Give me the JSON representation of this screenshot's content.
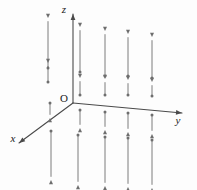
{
  "figure": {
    "background_color": "#fdfdfd",
    "axis_color": "#4a4a4a",
    "arrow_color": "#6e6e6e",
    "label_color": "#1a1a1a",
    "width": 197,
    "height": 190
  },
  "labels": {
    "origin": "O",
    "x_axis": "x",
    "y_axis": "y",
    "z_axis": "z"
  },
  "chart_data": {
    "type": "scatter",
    "xlabel": "x",
    "ylabel": "y",
    "zlabel": "z",
    "grid": false,
    "legend": null,
    "origin_px": [
      73,
      103
    ],
    "axes": [
      {
        "name": "z",
        "label": "z",
        "from_px": [
          73,
          103
        ],
        "to_px": [
          73,
          14
        ],
        "label_px": [
          64,
          13
        ],
        "direction": "up"
      },
      {
        "name": "y",
        "label": "y",
        "from_px": [
          73,
          103
        ],
        "to_px": [
          182,
          113
        ],
        "label_px": [
          178,
          124
        ],
        "direction": "right-down"
      },
      {
        "name": "x",
        "label": "x",
        "from_px": [
          73,
          103
        ],
        "to_px": [
          19,
          143
        ],
        "label_px": [
          13,
          142
        ],
        "direction": "left-down"
      }
    ],
    "arrows": [
      {
        "id": "up-a1",
        "x_px": 48,
        "tail_y_px": 68,
        "head_y_px": 18,
        "direction": "up",
        "length_px": 50
      },
      {
        "id": "up-a2",
        "x_px": 48,
        "tail_y_px": 82,
        "head_y_px": 63,
        "direction": "up",
        "length_px": 19
      },
      {
        "id": "up-b1",
        "x_px": 80,
        "tail_y_px": 72,
        "head_y_px": 27,
        "direction": "up",
        "length_px": 45
      },
      {
        "id": "up-b2",
        "x_px": 80,
        "tail_y_px": 95,
        "head_y_px": 78,
        "direction": "up",
        "length_px": 17
      },
      {
        "id": "up-c1",
        "x_px": 105,
        "tail_y_px": 76,
        "head_y_px": 31,
        "direction": "up",
        "length_px": 45
      },
      {
        "id": "up-c2",
        "x_px": 105,
        "tail_y_px": 95,
        "head_y_px": 79,
        "direction": "up",
        "length_px": 16
      },
      {
        "id": "up-d1",
        "x_px": 128,
        "tail_y_px": 76,
        "head_y_px": 34,
        "direction": "up",
        "length_px": 42
      },
      {
        "id": "up-d2",
        "x_px": 128,
        "tail_y_px": 95,
        "head_y_px": 80,
        "direction": "up",
        "length_px": 15
      },
      {
        "id": "up-e1",
        "x_px": 152,
        "tail_y_px": 78,
        "head_y_px": 37,
        "direction": "up",
        "length_px": 41
      },
      {
        "id": "up-e2",
        "x_px": 152,
        "tail_y_px": 96,
        "head_y_px": 82,
        "direction": "up",
        "length_px": 14
      },
      {
        "id": "dn-a1",
        "x_px": 50,
        "tail_y_px": 103,
        "head_y_px": 118,
        "direction": "down",
        "length_px": 15
      },
      {
        "id": "dn-a2",
        "x_px": 51,
        "tail_y_px": 131,
        "head_y_px": 180,
        "direction": "down",
        "length_px": 49
      },
      {
        "id": "dn-b1",
        "x_px": 80,
        "tail_y_px": 110,
        "head_y_px": 128,
        "direction": "down",
        "length_px": 18
      },
      {
        "id": "dn-b2",
        "x_px": 78,
        "tail_y_px": 135,
        "head_y_px": 185,
        "direction": "down",
        "length_px": 50
      },
      {
        "id": "dn-c1",
        "x_px": 105,
        "tail_y_px": 112,
        "head_y_px": 130,
        "direction": "down",
        "length_px": 18
      },
      {
        "id": "dn-c2",
        "x_px": 105,
        "tail_y_px": 137,
        "head_y_px": 186,
        "direction": "down",
        "length_px": 49
      },
      {
        "id": "dn-d1",
        "x_px": 128,
        "tail_y_px": 113,
        "head_y_px": 132,
        "direction": "down",
        "length_px": 19
      },
      {
        "id": "dn-d2",
        "x_px": 128,
        "tail_y_px": 138,
        "head_y_px": 187,
        "direction": "down",
        "length_px": 49
      },
      {
        "id": "dn-e1",
        "x_px": 152,
        "tail_y_px": 115,
        "head_y_px": 134,
        "direction": "down",
        "length_px": 19
      },
      {
        "id": "dn-e2",
        "x_px": 152,
        "tail_y_px": 140,
        "head_y_px": 188,
        "direction": "down",
        "length_px": 48
      }
    ]
  }
}
